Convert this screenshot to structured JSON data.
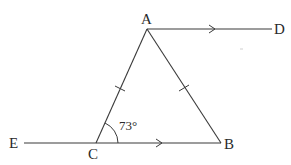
{
  "diagram": {
    "type": "geometry",
    "points": {
      "A": {
        "label": "A"
      },
      "B": {
        "label": "B"
      },
      "C": {
        "label": "C"
      },
      "D": {
        "label": "D"
      },
      "E": {
        "label": "E"
      }
    },
    "segments": [
      {
        "from": "A",
        "to": "C",
        "equal_mark": 1
      },
      {
        "from": "A",
        "to": "B",
        "equal_mark": 1
      },
      {
        "from": "E",
        "to": "B",
        "through": "C",
        "parallel_arrow": 1
      },
      {
        "from": "A",
        "to": "D",
        "parallel_arrow": 1
      }
    ],
    "angles": [
      {
        "vertex": "C",
        "between": [
          "B",
          "A"
        ],
        "label": "73°",
        "value_degrees": 73
      }
    ],
    "relations": {
      "equal_sides": [
        "AC",
        "AB"
      ],
      "parallel_lines": [
        "AD",
        "EB"
      ]
    }
  }
}
